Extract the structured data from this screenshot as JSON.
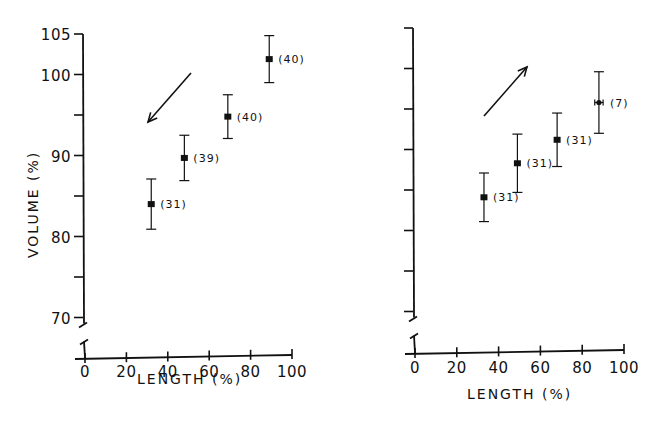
{
  "chart_data": [
    {
      "type": "scatter",
      "panel": "left",
      "title": "",
      "xlabel": "LENGTH (%)",
      "ylabel": "VOLUME (%)",
      "xlim": [
        0,
        100
      ],
      "ylim": [
        70,
        105
      ],
      "y_axis_break": true,
      "x_ticks": [
        0,
        20,
        40,
        60,
        80,
        100
      ],
      "y_ticks": [
        70,
        75,
        80,
        85,
        90,
        95,
        100,
        105
      ],
      "y_tick_labels": [
        "70",
        "",
        "80",
        "",
        "90",
        "",
        "100",
        "105"
      ],
      "grid": false,
      "arrow_direction": "down-left",
      "points": [
        {
          "x": 32,
          "y": 84.0,
          "yerr": 3.1,
          "xerr": 0.8,
          "n_label": "(31)"
        },
        {
          "x": 48,
          "y": 89.7,
          "yerr": 2.8,
          "xerr": 0.8,
          "n_label": "(39)"
        },
        {
          "x": 69,
          "y": 94.8,
          "yerr": 2.7,
          "xerr": 0.8,
          "n_label": "(40)"
        },
        {
          "x": 89,
          "y": 101.9,
          "yerr": 2.9,
          "xerr": 0.6,
          "n_label": "(40)"
        }
      ]
    },
    {
      "type": "scatter",
      "panel": "right",
      "title": "",
      "xlabel": "LENGTH (%)",
      "ylabel": "",
      "xlim": [
        0,
        100
      ],
      "ylim": [
        70,
        105
      ],
      "y_axis_break": true,
      "x_ticks": [
        0,
        20,
        40,
        60,
        80,
        100
      ],
      "y_ticks": [
        70,
        75,
        80,
        85,
        90,
        95,
        100,
        105
      ],
      "y_tick_labels": [
        "",
        "",
        "",
        "",
        "",
        "",
        "",
        ""
      ],
      "grid": false,
      "arrow_direction": "up-right",
      "points": [
        {
          "x": 33,
          "y": 84.1,
          "yerr": 3.0,
          "xerr": 0.8,
          "n_label": "(31)"
        },
        {
          "x": 49,
          "y": 88.3,
          "yerr": 3.6,
          "xerr": 0.8,
          "n_label": "(31)"
        },
        {
          "x": 68,
          "y": 91.2,
          "yerr": 3.3,
          "xerr": 0.8,
          "n_label": "(31)"
        },
        {
          "x": 88,
          "y": 95.8,
          "yerr": 3.8,
          "xerr": 2.0,
          "n_label": "(7)"
        }
      ]
    }
  ],
  "panels": {
    "left": {
      "xlabel": "LENGTH (%)",
      "ylabel": "VOLUME (%)"
    },
    "right": {
      "xlabel": "LENGTH (%)"
    }
  }
}
